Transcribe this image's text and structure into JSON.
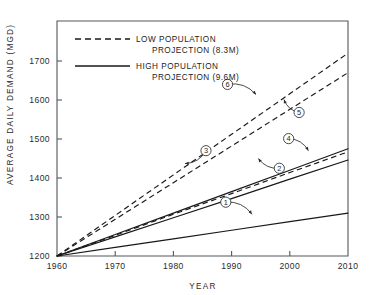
{
  "chart_data": {
    "type": "line",
    "title": "",
    "xlabel": "YEAR",
    "ylabel": "AVERAGE DAILY DEMAND (MGD)",
    "xlim": [
      1960,
      2010
    ],
    "ylim": [
      1200,
      1750
    ],
    "xticks": [
      "1960",
      "1970",
      "1980",
      "1990",
      "2000",
      "2010"
    ],
    "yticks": [
      "1200",
      "1300",
      "1400",
      "1500",
      "1600",
      "1700"
    ],
    "grid": false,
    "legend_position": "upper-left-inside",
    "legend": [
      {
        "id": "low",
        "style": "dashed",
        "line1": "LOW POPULATION",
        "line2": "PROJECTION (8.3M)"
      },
      {
        "id": "high",
        "style": "solid",
        "line1": "HIGH POPULATION",
        "line2": "PROJECTION (9.6M)"
      }
    ],
    "x": [
      1960,
      1970,
      1980,
      1990,
      2000,
      2010
    ],
    "series": [
      {
        "name": "1",
        "style": "solid",
        "population": "high",
        "values": [
          1200,
          1222,
          1244,
          1266,
          1288,
          1310
        ]
      },
      {
        "name": "2",
        "style": "solid",
        "population": "high",
        "values": [
          1200,
          1249,
          1298,
          1347,
          1397,
          1446
        ]
      },
      {
        "name": "3",
        "style": "dashed",
        "population": "low",
        "values": [
          1200,
          1253,
          1307,
          1360,
          1414,
          1467
        ]
      },
      {
        "name": "4",
        "style": "solid",
        "population": "high",
        "values": [
          1200,
          1255,
          1310,
          1365,
          1420,
          1475
        ]
      },
      {
        "name": "5",
        "style": "dashed",
        "population": "low",
        "values": [
          1200,
          1294,
          1388,
          1482,
          1576,
          1670
        ]
      },
      {
        "name": "6",
        "style": "dashed",
        "population": "low",
        "values": [
          1200,
          1304,
          1408,
          1512,
          1616,
          1720
        ]
      }
    ],
    "annotations": [
      {
        "label": "1",
        "circle_x": 1989.0,
        "circle_y": 1338,
        "point_x": 1993.5,
        "point_y": 1307
      },
      {
        "label": "2",
        "circle_x": 1998.2,
        "circle_y": 1425,
        "point_x": 1994.6,
        "point_y": 1450
      },
      {
        "label": "3",
        "circle_x": 1985.6,
        "circle_y": 1470,
        "point_x": 1982.0,
        "point_y": 1437
      },
      {
        "label": "4",
        "circle_x": 1999.8,
        "circle_y": 1501,
        "point_x": 2003.2,
        "point_y": 1470
      },
      {
        "label": "5",
        "circle_x": 2001.6,
        "circle_y": 1568,
        "point_x": 1999.0,
        "point_y": 1601
      },
      {
        "label": "6",
        "circle_x": 1989.3,
        "circle_y": 1640,
        "point_x": 1994.2,
        "point_y": 1614
      }
    ]
  }
}
